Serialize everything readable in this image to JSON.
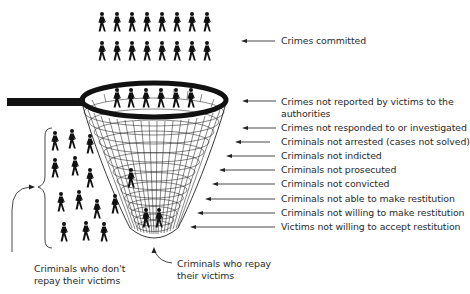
{
  "diagram": {
    "type": "funnel-net",
    "top_group": {
      "label": "Crimes committed",
      "rows": 2,
      "per_row": 8
    },
    "net_labels": [
      {
        "id": "not-reported",
        "text": "Crimes not reported by victims to the authorities",
        "line1": "Crimes not reported by victims to the",
        "line2": "authorities"
      },
      {
        "id": "not-responded",
        "text": "Crimes not responded to or investigated"
      },
      {
        "id": "not-arrested",
        "text": "Criminals not arrested (cases not solved)"
      },
      {
        "id": "not-indicted",
        "text": "Criminals not indicted"
      },
      {
        "id": "not-prosecuted",
        "text": "Criminals not prosecuted"
      },
      {
        "id": "not-convicted",
        "text": "Criminals not convicted"
      },
      {
        "id": "not-able",
        "text": "Criminals not able to make restitution"
      },
      {
        "id": "not-willing",
        "text": "Criminals not willing to make restitution"
      },
      {
        "id": "victims-not-willing",
        "text": "Victims not willing to accept restitution"
      }
    ],
    "bottom_labels": {
      "dont_repay": {
        "line1": "Criminals who don't",
        "line2": "repay their victims"
      },
      "repay": {
        "line1": "Criminals who repay",
        "line2": "their victims"
      }
    },
    "figures": {
      "in_net_rim": 6,
      "falling_out_left": 14,
      "inside_net_middle": 1,
      "at_net_bottom": 2
    },
    "colors": {
      "ink": "#111111",
      "text": "#2a2a2a",
      "background": "#ffffff"
    }
  }
}
